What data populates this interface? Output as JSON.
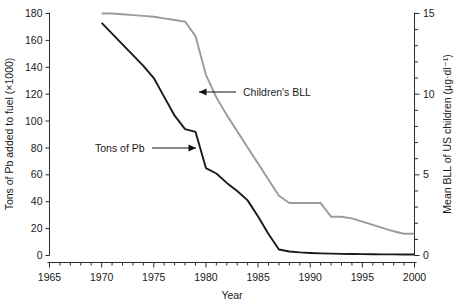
{
  "chart_data": {
    "type": "line",
    "title": "",
    "xlabel": "Year",
    "xlim": [
      1965,
      2000
    ],
    "xticks": [
      1965,
      1970,
      1975,
      1980,
      1985,
      1990,
      1995,
      2000
    ],
    "xtick_labels": [
      "1965",
      "1970",
      "1975",
      "1980",
      "1985",
      "1990",
      "1995",
      "2000"
    ],
    "x_minor_ticks": [
      1966,
      1967,
      1968,
      1969,
      1971,
      1972,
      1973,
      1974,
      1976,
      1977,
      1978,
      1979,
      1981,
      1982,
      1983,
      1984,
      1986,
      1987,
      1988,
      1989,
      1991,
      1992,
      1993,
      1994,
      1996,
      1997,
      1998,
      1999
    ],
    "grid": false,
    "legend_position": "none",
    "left_axis": {
      "label": "Tons of Pb added to fuel (×1000)",
      "ylim": [
        0,
        180
      ],
      "yticks": [
        0,
        20,
        40,
        60,
        80,
        100,
        120,
        140,
        160,
        180
      ],
      "ytick_labels": [
        "0",
        "20",
        "40",
        "60",
        "80",
        "100",
        "120",
        "140",
        "160",
        "180"
      ]
    },
    "right_axis": {
      "label": "Mean BLL of US children (µg·dl⁻¹)",
      "ylim": [
        0,
        15
      ],
      "yticks": [
        0,
        5,
        10,
        15
      ],
      "ytick_labels": [
        "0",
        "5",
        "10",
        "15"
      ],
      "y_minor_ticks": [
        1,
        2,
        3,
        4,
        6,
        7,
        8,
        9,
        11,
        12,
        13,
        14
      ]
    },
    "series": [
      {
        "name": "Tons of Pb",
        "axis": "left",
        "color": "#1a1a1a",
        "stroke_width": 1.9,
        "x": [
          1970,
          1971,
          1972,
          1973,
          1974,
          1975,
          1976,
          1977,
          1978,
          1979,
          1980,
          1981,
          1982,
          1983,
          1984,
          1985,
          1986,
          1987,
          1988,
          1989,
          1990,
          1991,
          1992,
          1993,
          1994,
          1995,
          1996,
          1997,
          1998,
          1999,
          2000
        ],
        "y": [
          173,
          165,
          157,
          149,
          141,
          132,
          118,
          104,
          94,
          92,
          65,
          61,
          54,
          48,
          41,
          29,
          16,
          4.5,
          3.0,
          2.3,
          1.9,
          1.6,
          1.4,
          1.2,
          1.1,
          1.0,
          0.9,
          0.8,
          0.8,
          0.7,
          0.7
        ]
      },
      {
        "name": "Children's BLL",
        "axis": "right",
        "color": "#9a9a9a",
        "stroke_width": 1.9,
        "x": [
          1970,
          1971,
          1972,
          1973,
          1974,
          1975,
          1976,
          1977,
          1978,
          1979,
          1980,
          1981,
          1982,
          1983,
          1984,
          1985,
          1986,
          1987,
          1988,
          1989,
          1990,
          1991,
          1992,
          1993,
          1994,
          1995,
          1996,
          1997,
          1998,
          1999,
          2000
        ],
        "y": [
          15.0,
          15.0,
          14.95,
          14.9,
          14.85,
          14.8,
          14.7,
          14.6,
          14.5,
          13.6,
          11.2,
          9.8,
          8.7,
          7.7,
          6.7,
          5.7,
          4.7,
          3.7,
          3.25,
          3.25,
          3.25,
          3.25,
          2.4,
          2.4,
          2.3,
          2.1,
          1.9,
          1.7,
          1.5,
          1.35,
          1.35
        ]
      }
    ],
    "annotations": [
      {
        "name": "tons-of-pb",
        "text": "Tons of Pb",
        "text_x": 95,
        "text_y": 152,
        "arrow_from_x": 152,
        "arrow_from_y": 148,
        "arrow_to_x": 196,
        "arrow_to_y": 148,
        "direction": "right"
      },
      {
        "name": "childrens-bll",
        "text": "Children's BLL",
        "text_x": 243,
        "text_y": 96,
        "arrow_from_x": 236,
        "arrow_from_y": 92,
        "arrow_to_x": 199,
        "arrow_to_y": 92,
        "direction": "left"
      }
    ]
  }
}
